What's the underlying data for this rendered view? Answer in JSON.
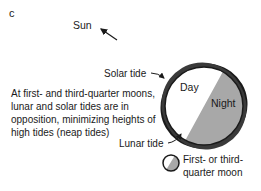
{
  "figure": {
    "panel_label": "c",
    "sun_label": "Sun",
    "caption": "At first- and third-quarter moons, lunar and solar tides are in opposition, minimizing heights of high tides (neap tides)",
    "earth": {
      "day_label": "Day",
      "night_label": "Night",
      "day_color": "#ffffff",
      "night_color": "#a8a8a8",
      "outline_color": "#1a1a1a"
    },
    "tide_labels": {
      "solar": "Solar tide",
      "lunar": "Lunar tide"
    },
    "legend": {
      "icon": "quarter-moon-icon",
      "label": "First- or third-quarter moon"
    }
  }
}
